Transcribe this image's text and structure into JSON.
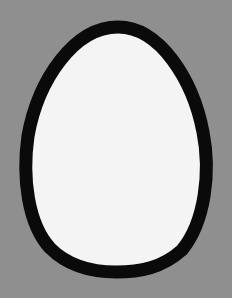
{
  "image": {
    "subject": "egg outline",
    "width": 232,
    "height": 298
  },
  "colors": {
    "background": "#8f8f8f",
    "outline": "#0a0a0a",
    "fill": "#f4f4f4"
  },
  "egg": {
    "outline_thickness_px": 13,
    "bounds": {
      "left": 20,
      "top": 21,
      "right": 213,
      "bottom": 278
    }
  }
}
